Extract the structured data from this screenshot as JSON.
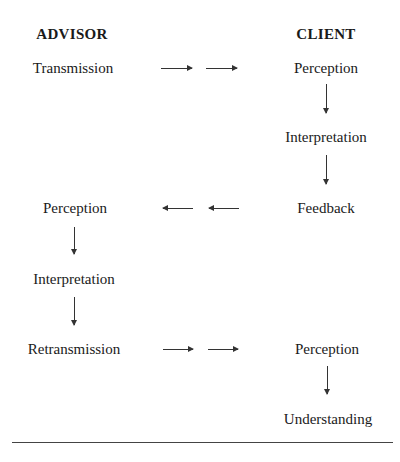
{
  "headers": {
    "left": "ADVISOR",
    "right": "CLIENT"
  },
  "nodes": {
    "advisor_transmission": "Transmission",
    "client_perception_1": "Perception",
    "client_interpretation": "Interpretation",
    "client_feedback": "Feedback",
    "advisor_perception": "Perception",
    "advisor_interpretation": "Interpretation",
    "advisor_retransmission": "Retransmission",
    "client_perception_2": "Perception",
    "client_understanding": "Understanding"
  },
  "edges": [
    {
      "from": "advisor_transmission",
      "to": "client_perception_1",
      "direction": "right"
    },
    {
      "from": "client_perception_1",
      "to": "client_interpretation",
      "direction": "down"
    },
    {
      "from": "client_interpretation",
      "to": "client_feedback",
      "direction": "down"
    },
    {
      "from": "client_feedback",
      "to": "advisor_perception",
      "direction": "left"
    },
    {
      "from": "advisor_perception",
      "to": "advisor_interpretation",
      "direction": "down"
    },
    {
      "from": "advisor_interpretation",
      "to": "advisor_retransmission",
      "direction": "down"
    },
    {
      "from": "advisor_retransmission",
      "to": "client_perception_2",
      "direction": "right"
    },
    {
      "from": "client_perception_2",
      "to": "client_understanding",
      "direction": "down"
    }
  ],
  "colors": {
    "text": "#1a1a1a",
    "arrow": "#333333",
    "background": "#ffffff"
  }
}
